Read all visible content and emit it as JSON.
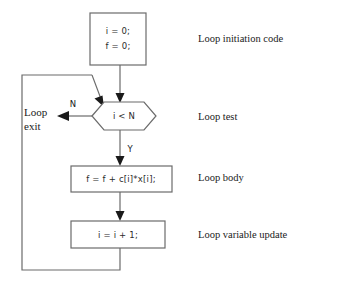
{
  "diagram": {
    "background_color": "#ffffff",
    "line_color": "#6b6b6b",
    "text_color": "#1a1a1a"
  },
  "nodes": {
    "init": {
      "shape": "rectangle",
      "line1": "i = 0;",
      "line2": "f = 0;"
    },
    "test": {
      "shape": "hexagon",
      "label": "i < N"
    },
    "body": {
      "shape": "rectangle",
      "label": "f = f + c[i]*x[i];"
    },
    "update": {
      "shape": "rectangle",
      "label": "i = i + 1;"
    }
  },
  "branches": {
    "no_label": "N",
    "yes_label": "Y",
    "exit_line1": "Loop",
    "exit_line2": "exit"
  },
  "annotations": [
    {
      "label": "Loop initiation code"
    },
    {
      "label": "Loop test"
    },
    {
      "label": "Loop body"
    },
    {
      "label": "Loop variable update"
    }
  ]
}
